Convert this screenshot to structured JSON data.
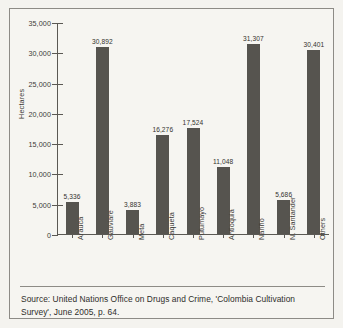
{
  "chart_data": {
    "type": "bar",
    "title": "",
    "xlabel": "",
    "ylabel": "Hectares",
    "ylim": [
      0,
      35000
    ],
    "grid": false,
    "legend": null,
    "categories": [
      "Arauca",
      "Gauviare",
      "Meta",
      "Caqueta",
      "Putumayo",
      "Antioquia",
      "Nariño",
      "N. Santander",
      "Others"
    ],
    "values": [
      5336,
      30892,
      3883,
      16276,
      17524,
      11048,
      31307,
      5686,
      30401
    ],
    "value_labels": [
      "5,336",
      "30,892",
      "3,883",
      "16,276",
      "17,524",
      "11,048",
      "31,307",
      "5,686",
      "30,401"
    ],
    "ytick_labels": [
      "35,000",
      "30,000",
      "25,000",
      "20,000",
      "15,000",
      "10,000",
      "5,000",
      "0"
    ],
    "ytick_values": [
      35000,
      30000,
      25000,
      20000,
      15000,
      10000,
      5000,
      0
    ],
    "bar_color": "#56544f",
    "axis_color": "#5b5954"
  },
  "caption": {
    "text": "Source: United Nations Office on Drugs and Crime, 'Colombia Cultivation Survey', June 2005, p. 64."
  }
}
